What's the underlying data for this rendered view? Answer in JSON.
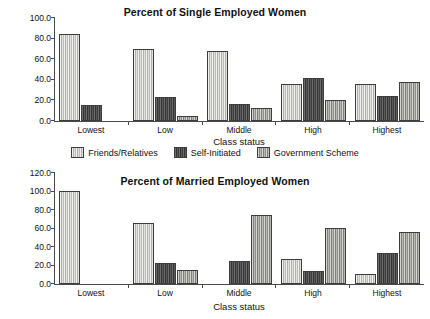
{
  "figure": {
    "series_names": [
      "Friends/Relatives",
      "Self-Initiated",
      "Government Scheme"
    ],
    "legend": [
      {
        "label": "Friends/Relatives",
        "color": "#c9c9c2"
      },
      {
        "label": "Self-Initiated",
        "color": "#4c4c4c"
      },
      {
        "label": "Government Scheme",
        "color": "#a3a39c"
      }
    ]
  },
  "chart_data": [
    {
      "type": "bar",
      "title": "Percent of Single Employed Women",
      "xlabel": "Class status",
      "ylabel": "",
      "categories": [
        "Lowest",
        "Low",
        "Middle",
        "High",
        "Highest"
      ],
      "ylim": [
        0,
        100
      ],
      "yticks": [
        0.0,
        20.0,
        40.0,
        60.0,
        80.0,
        100.0
      ],
      "ytick_labels": [
        "0.0",
        "20.0",
        "40.0",
        "60.0",
        "80.0",
        "100.0"
      ],
      "grid": false,
      "legend_position": "below",
      "series": [
        {
          "name": "Friends/Relatives",
          "values": [
            84,
            70,
            68,
            36,
            36
          ]
        },
        {
          "name": "Self-Initiated",
          "values": [
            16,
            23,
            17,
            42,
            24
          ]
        },
        {
          "name": "Government Scheme",
          "values": [
            null,
            5,
            13,
            20,
            38
          ]
        }
      ]
    },
    {
      "type": "bar",
      "title": "Percent of Married Employed Women",
      "xlabel": "Class status",
      "ylabel": "",
      "categories": [
        "Lowest",
        "Low",
        "Middle",
        "High",
        "Highest"
      ],
      "ylim": [
        0,
        120
      ],
      "yticks": [
        0.0,
        20.0,
        40.0,
        60.0,
        80.0,
        100.0,
        120.0
      ],
      "ytick_labels": [
        "0.0",
        "20.0",
        "40.0",
        "60.0",
        "80.0",
        "100.0",
        "120.0"
      ],
      "grid": false,
      "legend_position": "above",
      "series": [
        {
          "name": "Friends/Relatives",
          "values": [
            101,
            66,
            null,
            27,
            11
          ]
        },
        {
          "name": "Self-Initiated",
          "values": [
            null,
            23,
            25,
            14,
            34
          ]
        },
        {
          "name": "Government Scheme",
          "values": [
            null,
            15,
            75,
            61,
            56
          ]
        }
      ]
    }
  ]
}
